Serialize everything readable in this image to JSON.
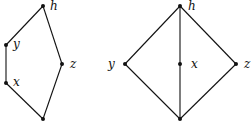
{
  "clipped_caption": "(…)",
  "diagrams": [
    {
      "name": "pentagon-lattice",
      "nodes": [
        {
          "id": "h",
          "label": "h",
          "x": 43,
          "y": 6,
          "lx": 50,
          "ly": 10
        },
        {
          "id": "y",
          "label": "y",
          "x": 6,
          "y": 45,
          "lx": 13,
          "ly": 48
        },
        {
          "id": "x",
          "label": "x",
          "x": 6,
          "y": 83,
          "lx": 13,
          "ly": 86
        },
        {
          "id": "z",
          "label": "z",
          "x": 62,
          "y": 64,
          "lx": 70,
          "ly": 68
        },
        {
          "id": "bottom",
          "label": "",
          "x": 43,
          "y": 119
        }
      ],
      "edges": [
        [
          "h",
          "y"
        ],
        [
          "y",
          "x"
        ],
        [
          "x",
          "bottom"
        ],
        [
          "bottom",
          "z"
        ],
        [
          "z",
          "h"
        ]
      ]
    },
    {
      "name": "diamond-lattice",
      "nodes": [
        {
          "id": "h",
          "label": "h",
          "x": 180,
          "y": 6,
          "lx": 188,
          "ly": 10
        },
        {
          "id": "y",
          "label": "y",
          "x": 125,
          "y": 64,
          "lx": 108,
          "ly": 68
        },
        {
          "id": "x",
          "label": "x",
          "x": 180,
          "y": 64,
          "lx": 191,
          "ly": 68
        },
        {
          "id": "z",
          "label": "z",
          "x": 236,
          "y": 64,
          "lx": 244,
          "ly": 68
        },
        {
          "id": "bottom",
          "label": "",
          "x": 180,
          "y": 119
        }
      ],
      "edges": [
        [
          "h",
          "y"
        ],
        [
          "h",
          "x"
        ],
        [
          "h",
          "z"
        ],
        [
          "y",
          "bottom"
        ],
        [
          "x",
          "bottom"
        ],
        [
          "z",
          "bottom"
        ]
      ]
    }
  ]
}
